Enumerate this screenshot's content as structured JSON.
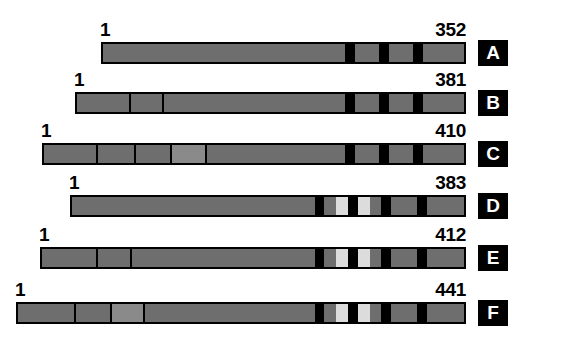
{
  "figure": {
    "type": "protein-domain-diagram",
    "background_color": "#ffffff",
    "bar_fill_color": "#6e6e6e",
    "bar_fill_light_color": "#8a8a8a",
    "band_dark_color": "#000000",
    "band_light_color": "#dcdcdc",
    "outline_color": "#000000",
    "label_box_color": "#000000",
    "label_text_color": "#ffffff"
  },
  "constructs": [
    {
      "id": "A",
      "letter": "A",
      "start_label": "1",
      "end_label": "352",
      "length_residues": 352,
      "row_top": 30,
      "bar_left": 101,
      "bar_right": 466,
      "bar_top": 42,
      "start_label_x": 100,
      "end_label_x": 466,
      "label_y": 20,
      "letter_box_x": 478,
      "letter_box_y": 40,
      "segments": [
        {
          "kind": "fill",
          "left": 0,
          "width": 242,
          "color": "#6e6e6e"
        },
        {
          "kind": "band-dark",
          "left": 242,
          "width": 10,
          "color": "#000000"
        },
        {
          "kind": "fill",
          "left": 252,
          "width": 24,
          "color": "#6e6e6e"
        },
        {
          "kind": "band-dark",
          "left": 276,
          "width": 10,
          "color": "#000000"
        },
        {
          "kind": "fill",
          "left": 286,
          "width": 24,
          "color": "#6e6e6e"
        },
        {
          "kind": "band-dark",
          "left": 310,
          "width": 10,
          "color": "#000000"
        },
        {
          "kind": "fill",
          "left": 320,
          "width": 45,
          "color": "#6e6e6e"
        }
      ],
      "dividers": []
    },
    {
      "id": "B",
      "letter": "B",
      "start_label": "1",
      "end_label": "381",
      "length_residues": 381,
      "row_top": 80,
      "bar_left": 75,
      "bar_right": 466,
      "bar_top": 92,
      "start_label_x": 74,
      "end_label_x": 466,
      "label_y": 70,
      "letter_box_x": 478,
      "letter_box_y": 90,
      "segments": [
        {
          "kind": "fill",
          "left": 0,
          "width": 268,
          "color": "#6e6e6e"
        },
        {
          "kind": "band-dark",
          "left": 268,
          "width": 10,
          "color": "#000000"
        },
        {
          "kind": "fill",
          "left": 278,
          "width": 24,
          "color": "#6e6e6e"
        },
        {
          "kind": "band-dark",
          "left": 302,
          "width": 10,
          "color": "#000000"
        },
        {
          "kind": "fill",
          "left": 312,
          "width": 24,
          "color": "#6e6e6e"
        },
        {
          "kind": "band-dark",
          "left": 336,
          "width": 10,
          "color": "#000000"
        },
        {
          "kind": "fill",
          "left": 346,
          "width": 45,
          "color": "#6e6e6e"
        }
      ],
      "dividers": [
        52,
        85
      ]
    },
    {
      "id": "C",
      "letter": "C",
      "start_label": "1",
      "end_label": "410",
      "length_residues": 410,
      "row_top": 130,
      "bar_left": 42,
      "bar_right": 466,
      "bar_top": 143,
      "start_label_x": 41,
      "end_label_x": 466,
      "label_y": 121,
      "letter_box_x": 478,
      "letter_box_y": 141,
      "segments": [
        {
          "kind": "fill",
          "left": 0,
          "width": 126,
          "color": "#6e6e6e"
        },
        {
          "kind": "fill-light",
          "left": 126,
          "width": 35,
          "color": "#8a8a8a"
        },
        {
          "kind": "fill",
          "left": 161,
          "width": 140,
          "color": "#6e6e6e"
        },
        {
          "kind": "band-dark",
          "left": 301,
          "width": 10,
          "color": "#000000"
        },
        {
          "kind": "fill",
          "left": 311,
          "width": 24,
          "color": "#6e6e6e"
        },
        {
          "kind": "band-dark",
          "left": 335,
          "width": 10,
          "color": "#000000"
        },
        {
          "kind": "fill",
          "left": 345,
          "width": 24,
          "color": "#6e6e6e"
        },
        {
          "kind": "band-dark",
          "left": 369,
          "width": 10,
          "color": "#000000"
        },
        {
          "kind": "fill",
          "left": 379,
          "width": 45,
          "color": "#6e6e6e"
        }
      ],
      "dividers": [
        52,
        90,
        126,
        161
      ]
    },
    {
      "id": "D",
      "letter": "D",
      "start_label": "1",
      "end_label": "383",
      "length_residues": 383,
      "row_top": 182,
      "bar_left": 70,
      "bar_right": 466,
      "bar_top": 195,
      "start_label_x": 69,
      "end_label_x": 466,
      "label_y": 173,
      "letter_box_x": 478,
      "letter_box_y": 193,
      "segments": [
        {
          "kind": "fill",
          "left": 0,
          "width": 243,
          "color": "#6e6e6e"
        },
        {
          "kind": "band-dark",
          "left": 243,
          "width": 9,
          "color": "#000000"
        },
        {
          "kind": "fill",
          "left": 252,
          "width": 12,
          "color": "#6e6e6e"
        },
        {
          "kind": "band-light",
          "left": 264,
          "width": 12,
          "color": "#dcdcdc"
        },
        {
          "kind": "band-dark",
          "left": 276,
          "width": 10,
          "color": "#000000"
        },
        {
          "kind": "band-light",
          "left": 286,
          "width": 12,
          "color": "#dcdcdc"
        },
        {
          "kind": "fill",
          "left": 298,
          "width": 11,
          "color": "#6e6e6e"
        },
        {
          "kind": "band-dark",
          "left": 309,
          "width": 10,
          "color": "#000000"
        },
        {
          "kind": "fill",
          "left": 319,
          "width": 26,
          "color": "#6e6e6e"
        },
        {
          "kind": "band-dark",
          "left": 345,
          "width": 10,
          "color": "#000000"
        },
        {
          "kind": "fill",
          "left": 355,
          "width": 41,
          "color": "#6e6e6e"
        }
      ],
      "dividers": []
    },
    {
      "id": "E",
      "letter": "E",
      "start_label": "1",
      "end_label": "412",
      "length_residues": 412,
      "row_top": 234,
      "bar_left": 40,
      "bar_right": 466,
      "bar_top": 247,
      "start_label_x": 39,
      "end_label_x": 466,
      "label_y": 225,
      "letter_box_x": 478,
      "letter_box_y": 245,
      "segments": [
        {
          "kind": "fill",
          "left": 0,
          "width": 273,
          "color": "#6e6e6e"
        },
        {
          "kind": "band-dark",
          "left": 273,
          "width": 9,
          "color": "#000000"
        },
        {
          "kind": "fill",
          "left": 282,
          "width": 12,
          "color": "#6e6e6e"
        },
        {
          "kind": "band-light",
          "left": 294,
          "width": 12,
          "color": "#dcdcdc"
        },
        {
          "kind": "band-dark",
          "left": 306,
          "width": 10,
          "color": "#000000"
        },
        {
          "kind": "band-light",
          "left": 316,
          "width": 12,
          "color": "#dcdcdc"
        },
        {
          "kind": "fill",
          "left": 328,
          "width": 11,
          "color": "#6e6e6e"
        },
        {
          "kind": "band-dark",
          "left": 339,
          "width": 10,
          "color": "#000000"
        },
        {
          "kind": "fill",
          "left": 349,
          "width": 26,
          "color": "#6e6e6e"
        },
        {
          "kind": "band-dark",
          "left": 375,
          "width": 10,
          "color": "#000000"
        },
        {
          "kind": "fill",
          "left": 385,
          "width": 41,
          "color": "#6e6e6e"
        }
      ],
      "dividers": [
        54,
        88
      ]
    },
    {
      "id": "F",
      "letter": "F",
      "start_label": "1",
      "end_label": "441",
      "length_residues": 441,
      "row_top": 288,
      "bar_left": 16,
      "bar_right": 466,
      "bar_top": 302,
      "start_label_x": 15,
      "end_label_x": 466,
      "label_y": 280,
      "letter_box_x": 478,
      "letter_box_y": 300,
      "segments": [
        {
          "kind": "fill",
          "left": 0,
          "width": 92,
          "color": "#6e6e6e"
        },
        {
          "kind": "fill-light",
          "left": 92,
          "width": 33,
          "color": "#8a8a8a"
        },
        {
          "kind": "fill",
          "left": 125,
          "width": 172,
          "color": "#6e6e6e"
        },
        {
          "kind": "band-dark",
          "left": 297,
          "width": 9,
          "color": "#000000"
        },
        {
          "kind": "fill",
          "left": 306,
          "width": 12,
          "color": "#6e6e6e"
        },
        {
          "kind": "band-light",
          "left": 318,
          "width": 12,
          "color": "#dcdcdc"
        },
        {
          "kind": "band-dark",
          "left": 330,
          "width": 10,
          "color": "#000000"
        },
        {
          "kind": "band-light",
          "left": 340,
          "width": 12,
          "color": "#dcdcdc"
        },
        {
          "kind": "fill",
          "left": 352,
          "width": 11,
          "color": "#6e6e6e"
        },
        {
          "kind": "band-dark",
          "left": 363,
          "width": 10,
          "color": "#000000"
        },
        {
          "kind": "fill",
          "left": 373,
          "width": 26,
          "color": "#6e6e6e"
        },
        {
          "kind": "band-dark",
          "left": 399,
          "width": 10,
          "color": "#000000"
        },
        {
          "kind": "fill",
          "left": 409,
          "width": 41,
          "color": "#6e6e6e"
        }
      ],
      "dividers": [
        56,
        92,
        125
      ]
    }
  ]
}
